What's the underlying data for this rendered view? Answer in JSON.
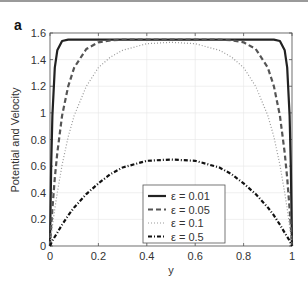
{
  "panel_label": "a",
  "chart_data": {
    "type": "line",
    "title": "",
    "xlabel": "y",
    "ylabel": "Potential and Velocity",
    "xlim": [
      0,
      1
    ],
    "ylim": [
      0,
      1.6
    ],
    "xticks": [
      "0",
      "0.2",
      "0.4",
      "0.6",
      "0.8",
      "1"
    ],
    "yticks": [
      "0",
      "0.2",
      "0.4",
      "0.6",
      "0.8",
      "1",
      "1.2",
      "1.4",
      "1.6"
    ],
    "grid": true,
    "legend_position": "lower center",
    "x": [
      0,
      0.005,
      0.01,
      0.02,
      0.03,
      0.05,
      0.075,
      0.1,
      0.15,
      0.2,
      0.25,
      0.3,
      0.4,
      0.5,
      0.6,
      0.7,
      0.75,
      0.8,
      0.85,
      0.9,
      0.925,
      0.95,
      0.97,
      0.98,
      0.99,
      0.995,
      1
    ],
    "series": [
      {
        "name": "ε = 0.01",
        "style": "solid",
        "width": 2.2,
        "values": [
          0,
          0.61,
          0.98,
          1.34,
          1.47,
          1.54,
          1.55,
          1.55,
          1.55,
          1.55,
          1.55,
          1.55,
          1.55,
          1.55,
          1.55,
          1.55,
          1.55,
          1.55,
          1.55,
          1.55,
          1.55,
          1.54,
          1.47,
          1.34,
          0.98,
          0.61,
          0
        ]
      },
      {
        "name": "ε = 0.05",
        "style": "dashed",
        "width": 2.2,
        "values": [
          0,
          0.15,
          0.28,
          0.51,
          0.7,
          0.98,
          1.2,
          1.34,
          1.48,
          1.53,
          1.545,
          1.55,
          1.55,
          1.55,
          1.55,
          1.55,
          1.545,
          1.53,
          1.48,
          1.34,
          1.2,
          0.98,
          0.7,
          0.51,
          0.28,
          0.15,
          0
        ]
      },
      {
        "name": "ε = 0.1",
        "style": "dotted",
        "width": 1.2,
        "values": [
          0,
          0.08,
          0.15,
          0.28,
          0.4,
          0.61,
          0.82,
          0.98,
          1.2,
          1.34,
          1.42,
          1.47,
          1.52,
          1.53,
          1.52,
          1.47,
          1.42,
          1.34,
          1.2,
          0.98,
          0.82,
          0.61,
          0.4,
          0.28,
          0.15,
          0.08,
          0
        ]
      },
      {
        "name": "ε = 0.5",
        "style": "dashdot",
        "width": 2.2,
        "values": [
          0,
          0.02,
          0.04,
          0.07,
          0.1,
          0.16,
          0.23,
          0.29,
          0.39,
          0.47,
          0.54,
          0.59,
          0.64,
          0.65,
          0.64,
          0.59,
          0.54,
          0.47,
          0.39,
          0.29,
          0.23,
          0.16,
          0.1,
          0.07,
          0.04,
          0.02,
          0
        ]
      }
    ]
  }
}
